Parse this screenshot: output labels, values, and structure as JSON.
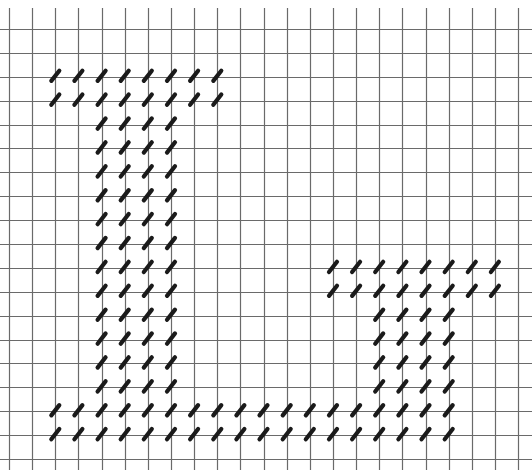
{
  "figure": {
    "background_color": "#ffffff",
    "grid_color": "#6a6a6a",
    "stitch_color": "#1a1a1a"
  },
  "grid": {
    "columns": 23,
    "rows": 19,
    "x0": 9,
    "x_step": 23.14,
    "y0": 29,
    "y_step": 23.89,
    "vertical_top": 8,
    "vertical_bottom": 470,
    "horizontal_left": 0,
    "horizontal_right": 532
  },
  "stitch": {
    "length": 13,
    "thickness": 4.2,
    "angle_deg": -52
  },
  "stitch_blocks": [
    {
      "name": "top-bar-left-motif",
      "rows": [
        2,
        3
      ],
      "cols": [
        2,
        9
      ]
    },
    {
      "name": "stem-left-motif",
      "rows": [
        4,
        15
      ],
      "cols": [
        4,
        7
      ]
    },
    {
      "name": "top-bar-right-motif",
      "rows": [
        10,
        11
      ],
      "cols": [
        14,
        21
      ]
    },
    {
      "name": "stem-right-motif",
      "rows": [
        12,
        15
      ],
      "cols": [
        16,
        19
      ]
    },
    {
      "name": "base-bar",
      "rows": [
        16,
        17
      ],
      "cols": [
        2,
        19
      ]
    }
  ]
}
